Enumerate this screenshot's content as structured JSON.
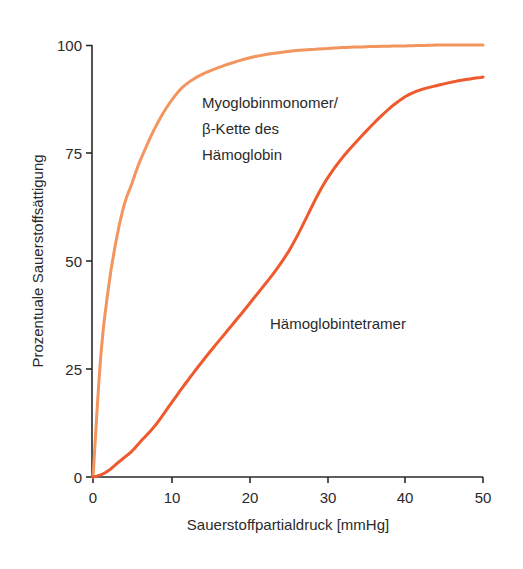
{
  "chart_data": {
    "type": "line",
    "title": "",
    "xlabel": "Sauerstoffpartialdruck [mmHg]",
    "ylabel": "Prozentuale Sauerstoffsättigung",
    "xlim": [
      0,
      50
    ],
    "ylim": [
      0,
      100
    ],
    "xticks": [
      0,
      10,
      20,
      30,
      40,
      50
    ],
    "yticks": [
      0,
      25,
      50,
      75,
      100
    ],
    "grid": false,
    "legend": "none (inline annotations)",
    "x": [
      0,
      1,
      2,
      3,
      4,
      5,
      6,
      8,
      10,
      12,
      15,
      20,
      25,
      30,
      35,
      40,
      45,
      50
    ],
    "series": [
      {
        "name": "Myoglobinmonomer/β-Kette des Hämoglobin",
        "color": "#F2955F",
        "values": [
          0,
          28,
          44,
          55,
          63,
          68,
          73,
          81,
          87,
          91,
          94,
          97,
          98.5,
          99.2,
          99.6,
          99.8,
          100,
          100
        ]
      },
      {
        "name": "Hämoglobintetramer",
        "color": "#EE5A2C",
        "values": [
          0,
          0.5,
          1.5,
          3,
          4.5,
          6,
          8,
          12,
          17,
          22,
          29,
          40,
          52,
          69,
          80,
          88,
          91,
          92.6
        ]
      }
    ],
    "annotations": [
      {
        "text_lines": [
          "Myoglobinmonomer/",
          "β-Kette des",
          "Hämoglobin"
        ],
        "x": 14,
        "y": 90
      },
      {
        "text": "Hämoglobintetramer",
        "x": 23,
        "y": 36
      }
    ]
  },
  "labels": {
    "ylabel": "Prozentuale Sauerstoffsättigung",
    "xlabel": "Sauerstoffpartialdruck [mmHg]",
    "anno_myo_1": "Myoglobinmonomer/",
    "anno_myo_2": "β-Kette des",
    "anno_myo_3": "Hämoglobin",
    "anno_hb": "Hämoglobintetramer",
    "xt0": "0",
    "xt1": "10",
    "xt2": "20",
    "xt3": "30",
    "xt4": "40",
    "xt5": "50",
    "yt0": "0",
    "yt1": "25",
    "yt2": "50",
    "yt3": "75",
    "yt4": "100"
  }
}
